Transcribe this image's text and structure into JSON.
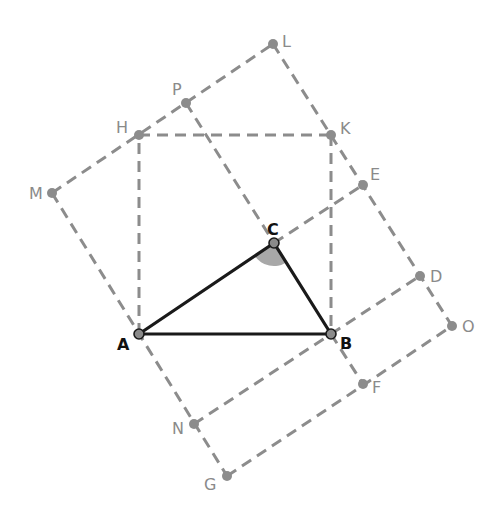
{
  "diagram": {
    "title": "",
    "colors": {
      "construction": "#8c8c8c",
      "triangle": "#1a1a1a",
      "angle_fill": "#a8a8a8",
      "background": "#ffffff"
    },
    "points": {
      "A": {
        "label": "A",
        "x": 139,
        "y": 334,
        "main": true
      },
      "B": {
        "label": "B",
        "x": 331,
        "y": 334,
        "main": true
      },
      "C": {
        "label": "C",
        "x": 274,
        "y": 243,
        "main": true
      },
      "H": {
        "label": "H",
        "x": 139,
        "y": 135
      },
      "K": {
        "label": "K",
        "x": 331,
        "y": 135
      },
      "P": {
        "label": "P",
        "x": 186,
        "y": 103
      },
      "L": {
        "label": "L",
        "x": 273,
        "y": 44
      },
      "M": {
        "label": "M",
        "x": 52,
        "y": 193
      },
      "E": {
        "label": "E",
        "x": 363,
        "y": 185
      },
      "D": {
        "label": "D",
        "x": 420,
        "y": 276
      },
      "O": {
        "label": "O",
        "x": 452,
        "y": 326
      },
      "F": {
        "label": "F",
        "x": 363,
        "y": 384
      },
      "N": {
        "label": "N",
        "x": 194,
        "y": 424
      },
      "G": {
        "label": "G",
        "x": 227,
        "y": 476
      }
    },
    "triangle": [
      "A",
      "B",
      "C"
    ],
    "marked_angle": "ACB",
    "dashed_segments": [
      [
        "A",
        "H"
      ],
      [
        "H",
        "K"
      ],
      [
        "K",
        "B"
      ],
      [
        "M",
        "L"
      ],
      [
        "M",
        "A"
      ],
      [
        "A",
        "N"
      ],
      [
        "N",
        "G"
      ],
      [
        "L",
        "O"
      ],
      [
        "P",
        "C"
      ],
      [
        "C",
        "E"
      ],
      [
        "B",
        "D"
      ],
      [
        "B",
        "F"
      ],
      [
        "G",
        "O"
      ],
      [
        "N",
        "B"
      ]
    ],
    "labels": {
      "A": "A",
      "B": "B",
      "C": "C",
      "H": "H",
      "K": "K",
      "P": "P",
      "L": "L",
      "M": "M",
      "E": "E",
      "D": "D",
      "O": "O",
      "F": "F",
      "N": "N",
      "G": "G"
    }
  }
}
